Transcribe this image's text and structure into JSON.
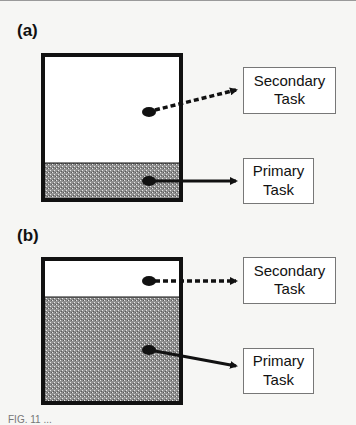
{
  "panels": [
    {
      "label": "(a)",
      "secondary": {
        "line1": "Secondary",
        "line2": "Task"
      },
      "primary": {
        "line1": "Primary",
        "line2": "Task"
      },
      "primary_fill_fraction": 0.25
    },
    {
      "label": "(b)",
      "secondary": {
        "line1": "Secondary",
        "line2": "Task"
      },
      "primary": {
        "line1": "Primary",
        "line2": "Task"
      },
      "primary_fill_fraction": 0.73
    }
  ],
  "colors": {
    "outline": "#111111",
    "fill_pattern_base": "#9a9a9a",
    "task_box_border": "#777777",
    "background": "#f6f6f4"
  },
  "caption_partial": "FIG. 11 ..."
}
